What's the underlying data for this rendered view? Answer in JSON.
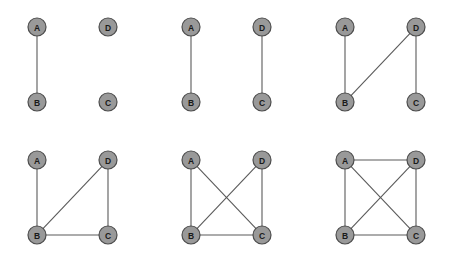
{
  "figure": {
    "title": "",
    "background_color": "#ffffff",
    "node_fill": "#999999",
    "node_stroke": "#4d4d4d",
    "edge_color": "#5a5a5a",
    "label_color": "#1a1a1a",
    "node_radius": 9,
    "panel_columns": 3,
    "panel_rows": 2
  },
  "chart_data": {
    "type": "diagram",
    "subtype": "graph-sequence",
    "title": "",
    "vertex_labels": [
      "A",
      "B",
      "C",
      "D"
    ],
    "vertex_positions": {
      "A": {
        "x": 37,
        "y": 27
      },
      "D": {
        "x": 108,
        "y": 27
      },
      "B": {
        "x": 37,
        "y": 102
      },
      "C": {
        "x": 108,
        "y": 102
      }
    },
    "panels": [
      {
        "index": 1,
        "origin": {
          "x": 0,
          "y": 0
        },
        "nodes": [
          "A",
          "B",
          "C",
          "D"
        ],
        "edges": [
          [
            "A",
            "B"
          ]
        ],
        "edge_count": 1
      },
      {
        "index": 2,
        "origin": {
          "x": 154,
          "y": 0
        },
        "nodes": [
          "A",
          "B",
          "C",
          "D"
        ],
        "edges": [
          [
            "A",
            "B"
          ],
          [
            "D",
            "C"
          ]
        ],
        "edge_count": 2
      },
      {
        "index": 3,
        "origin": {
          "x": 308,
          "y": 0
        },
        "nodes": [
          "A",
          "B",
          "C",
          "D"
        ],
        "edges": [
          [
            "A",
            "B"
          ],
          [
            "D",
            "C"
          ],
          [
            "B",
            "D"
          ]
        ],
        "edge_count": 3
      },
      {
        "index": 4,
        "origin": {
          "x": 0,
          "y": 133
        },
        "nodes": [
          "A",
          "B",
          "C",
          "D"
        ],
        "edges": [
          [
            "A",
            "B"
          ],
          [
            "D",
            "C"
          ],
          [
            "B",
            "D"
          ],
          [
            "B",
            "C"
          ]
        ],
        "edge_count": 4
      },
      {
        "index": 5,
        "origin": {
          "x": 154,
          "y": 133
        },
        "nodes": [
          "A",
          "B",
          "C",
          "D"
        ],
        "edges": [
          [
            "A",
            "B"
          ],
          [
            "D",
            "C"
          ],
          [
            "B",
            "D"
          ],
          [
            "B",
            "C"
          ],
          [
            "A",
            "C"
          ]
        ],
        "edge_count": 5
      },
      {
        "index": 6,
        "origin": {
          "x": 308,
          "y": 133
        },
        "nodes": [
          "A",
          "B",
          "C",
          "D"
        ],
        "edges": [
          [
            "A",
            "B"
          ],
          [
            "D",
            "C"
          ],
          [
            "B",
            "D"
          ],
          [
            "B",
            "C"
          ],
          [
            "A",
            "C"
          ],
          [
            "A",
            "D"
          ]
        ],
        "edge_count": 6
      }
    ]
  }
}
